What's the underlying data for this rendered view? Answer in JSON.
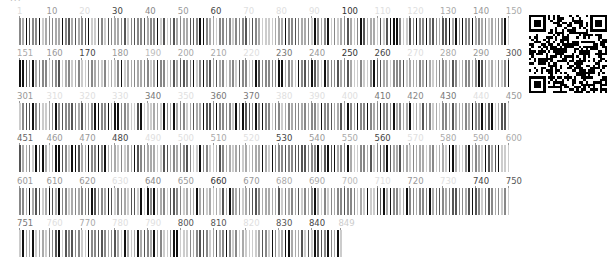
{
  "figure": {
    "type": "sequence-conservation-barcode",
    "sequence_length": 849,
    "positions_per_row": 150,
    "top_text_cut_off": "..."
  },
  "rows": [
    {
      "start": 1,
      "end": 150,
      "labels": [
        {
          "pos": 1,
          "text": "1",
          "shade": "#dddddd"
        },
        {
          "pos": 10,
          "text": "10",
          "shade": "#999999"
        },
        {
          "pos": 20,
          "text": "20",
          "shade": "#dddddd"
        },
        {
          "pos": 30,
          "text": "30",
          "shade": "#444444"
        },
        {
          "pos": 40,
          "text": "40",
          "shade": "#888888"
        },
        {
          "pos": 50,
          "text": "50",
          "shade": "#999999"
        },
        {
          "pos": 60,
          "text": "60",
          "shade": "#444444"
        },
        {
          "pos": 70,
          "text": "70",
          "shade": "#e0e0e0"
        },
        {
          "pos": 80,
          "text": "80",
          "shade": "#e0e0e0"
        },
        {
          "pos": 90,
          "text": "90",
          "shade": "#e0e0e0"
        },
        {
          "pos": 100,
          "text": "100",
          "shade": "#333333"
        },
        {
          "pos": 110,
          "text": "110",
          "shade": "#e0e0e0"
        },
        {
          "pos": 120,
          "text": "120",
          "shade": "#e0e0e0"
        },
        {
          "pos": 130,
          "text": "130",
          "shade": "#aaaaaa"
        },
        {
          "pos": 140,
          "text": "140",
          "shade": "#999999"
        },
        {
          "pos": 150,
          "text": "150",
          "shade": "#aaaaaa"
        }
      ]
    },
    {
      "start": 151,
      "end": 300,
      "labels": [
        {
          "pos": 151,
          "text": "151",
          "shade": "#aaaaaa"
        },
        {
          "pos": 160,
          "text": "160",
          "shade": "#999999"
        },
        {
          "pos": 170,
          "text": "170",
          "shade": "#444444"
        },
        {
          "pos": 180,
          "text": "180",
          "shade": "#999999"
        },
        {
          "pos": 190,
          "text": "190",
          "shade": "#bbbbbb"
        },
        {
          "pos": 200,
          "text": "200",
          "shade": "#aaaaaa"
        },
        {
          "pos": 210,
          "text": "210",
          "shade": "#aaaaaa"
        },
        {
          "pos": 220,
          "text": "220",
          "shade": "#e0e0e0"
        },
        {
          "pos": 230,
          "text": "230",
          "shade": "#777777"
        },
        {
          "pos": 240,
          "text": "240",
          "shade": "#999999"
        },
        {
          "pos": 250,
          "text": "250",
          "shade": "#333333"
        },
        {
          "pos": 260,
          "text": "260",
          "shade": "#444444"
        },
        {
          "pos": 270,
          "text": "270",
          "shade": "#e0e0e0"
        },
        {
          "pos": 280,
          "text": "280",
          "shade": "#aaaaaa"
        },
        {
          "pos": 290,
          "text": "290",
          "shade": "#999999"
        },
        {
          "pos": 300,
          "text": "300",
          "shade": "#555555"
        }
      ]
    },
    {
      "start": 301,
      "end": 450,
      "labels": [
        {
          "pos": 301,
          "text": "301",
          "shade": "#999999"
        },
        {
          "pos": 310,
          "text": "310",
          "shade": "#e0e0e0"
        },
        {
          "pos": 320,
          "text": "320",
          "shade": "#e0e0e0"
        },
        {
          "pos": 330,
          "text": "330",
          "shade": "#e0e0e0"
        },
        {
          "pos": 340,
          "text": "340",
          "shade": "#777777"
        },
        {
          "pos": 350,
          "text": "350",
          "shade": "#e0e0e0"
        },
        {
          "pos": 360,
          "text": "360",
          "shade": "#777777"
        },
        {
          "pos": 370,
          "text": "370",
          "shade": "#777777"
        },
        {
          "pos": 380,
          "text": "380",
          "shade": "#e0e0e0"
        },
        {
          "pos": 390,
          "text": "390",
          "shade": "#e0e0e0"
        },
        {
          "pos": 400,
          "text": "400",
          "shade": "#e0e0e0"
        },
        {
          "pos": 410,
          "text": "410",
          "shade": "#777777"
        },
        {
          "pos": 420,
          "text": "420",
          "shade": "#888888"
        },
        {
          "pos": 430,
          "text": "430",
          "shade": "#777777"
        },
        {
          "pos": 440,
          "text": "440",
          "shade": "#e0e0e0"
        },
        {
          "pos": 450,
          "text": "450",
          "shade": "#999999"
        }
      ]
    },
    {
      "start": 451,
      "end": 600,
      "labels": [
        {
          "pos": 451,
          "text": "451",
          "shade": "#666666"
        },
        {
          "pos": 460,
          "text": "460",
          "shade": "#999999"
        },
        {
          "pos": 470,
          "text": "470",
          "shade": "#999999"
        },
        {
          "pos": 480,
          "text": "480",
          "shade": "#444444"
        },
        {
          "pos": 490,
          "text": "490",
          "shade": "#e0e0e0"
        },
        {
          "pos": 500,
          "text": "500",
          "shade": "#e0e0e0"
        },
        {
          "pos": 510,
          "text": "510",
          "shade": "#aaaaaa"
        },
        {
          "pos": 520,
          "text": "520",
          "shade": "#e0e0e0"
        },
        {
          "pos": 530,
          "text": "530",
          "shade": "#444444"
        },
        {
          "pos": 540,
          "text": "540",
          "shade": "#999999"
        },
        {
          "pos": 550,
          "text": "550",
          "shade": "#aaaaaa"
        },
        {
          "pos": 560,
          "text": "560",
          "shade": "#444444"
        },
        {
          "pos": 570,
          "text": "570",
          "shade": "#e0e0e0"
        },
        {
          "pos": 580,
          "text": "580",
          "shade": "#aaaaaa"
        },
        {
          "pos": 590,
          "text": "590",
          "shade": "#aaaaaa"
        },
        {
          "pos": 600,
          "text": "600",
          "shade": "#aaaaaa"
        }
      ]
    },
    {
      "start": 601,
      "end": 750,
      "labels": [
        {
          "pos": 601,
          "text": "601",
          "shade": "#999999"
        },
        {
          "pos": 610,
          "text": "610",
          "shade": "#999999"
        },
        {
          "pos": 620,
          "text": "620",
          "shade": "#999999"
        },
        {
          "pos": 630,
          "text": "630",
          "shade": "#e0e0e0"
        },
        {
          "pos": 640,
          "text": "640",
          "shade": "#888888"
        },
        {
          "pos": 650,
          "text": "650",
          "shade": "#999999"
        },
        {
          "pos": 660,
          "text": "660",
          "shade": "#333333"
        },
        {
          "pos": 670,
          "text": "670",
          "shade": "#999999"
        },
        {
          "pos": 680,
          "text": "680",
          "shade": "#aaaaaa"
        },
        {
          "pos": 690,
          "text": "690",
          "shade": "#aaaaaa"
        },
        {
          "pos": 700,
          "text": "700",
          "shade": "#bbbbbb"
        },
        {
          "pos": 710,
          "text": "710",
          "shade": "#e0e0e0"
        },
        {
          "pos": 720,
          "text": "720",
          "shade": "#999999"
        },
        {
          "pos": 730,
          "text": "730",
          "shade": "#e0e0e0"
        },
        {
          "pos": 740,
          "text": "740",
          "shade": "#444444"
        },
        {
          "pos": 750,
          "text": "750",
          "shade": "#555555"
        }
      ]
    },
    {
      "start": 751,
      "end": 849,
      "labels": [
        {
          "pos": 751,
          "text": "751",
          "shade": "#777777"
        },
        {
          "pos": 760,
          "text": "760",
          "shade": "#e0e0e0"
        },
        {
          "pos": 770,
          "text": "770",
          "shade": "#aaaaaa"
        },
        {
          "pos": 780,
          "text": "780",
          "shade": "#e0e0e0"
        },
        {
          "pos": 790,
          "text": "790",
          "shade": "#e0e0e0"
        },
        {
          "pos": 800,
          "text": "800",
          "shade": "#555555"
        },
        {
          "pos": 810,
          "text": "810",
          "shade": "#555555"
        },
        {
          "pos": 820,
          "text": "820",
          "shade": "#e0e0e0"
        },
        {
          "pos": 830,
          "text": "830",
          "shade": "#555555"
        },
        {
          "pos": 840,
          "text": "840",
          "shade": "#444444"
        },
        {
          "pos": 849,
          "text": "849",
          "shade": "#cccccc"
        }
      ]
    }
  ],
  "qr_code": {
    "label": "qr-code",
    "modules": 33
  }
}
